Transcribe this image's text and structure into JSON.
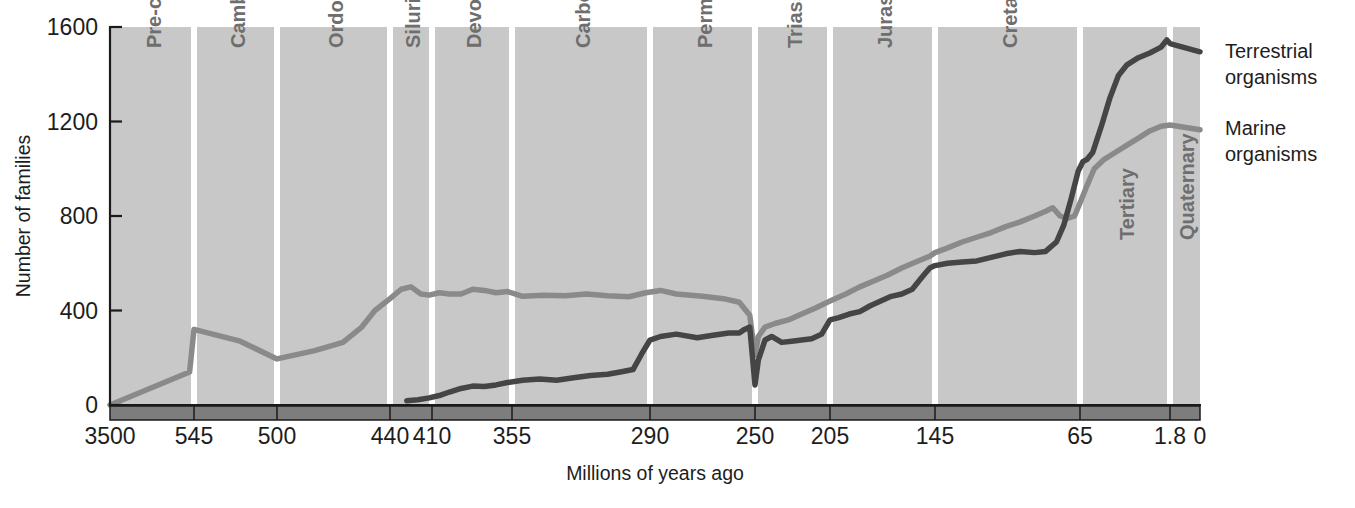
{
  "chart_data": {
    "type": "line",
    "title": "",
    "xlabel": "Millions of years ago",
    "ylabel": "Number of families",
    "ylim": [
      0,
      1600
    ],
    "yticks": [
      0,
      400,
      800,
      1200,
      1600
    ],
    "ytick_labels": [
      "0",
      "400",
      "800",
      "1200",
      "1600"
    ],
    "xticks": [
      3500,
      545,
      500,
      440,
      410,
      355,
      290,
      250,
      205,
      145,
      65,
      1.8,
      0
    ],
    "xtick_labels": [
      "3500",
      "545",
      "500",
      "440",
      "410",
      "355",
      "290",
      "250",
      "205",
      "145",
      "65",
      "1.8",
      "0"
    ],
    "x_axis_direction": "reversed",
    "grid": false,
    "legend_position": "right",
    "bands": [
      {
        "label": "Pre-cambrian",
        "start": 3500,
        "end": 545
      },
      {
        "label": "Cambrian",
        "start": 545,
        "end": 500
      },
      {
        "label": "Ordovician",
        "start": 500,
        "end": 440
      },
      {
        "label": "Silurian",
        "start": 440,
        "end": 410
      },
      {
        "label": "Devonian",
        "start": 410,
        "end": 355
      },
      {
        "label": "Carboniferous",
        "start": 355,
        "end": 290
      },
      {
        "label": "Permian",
        "start": 290,
        "end": 250
      },
      {
        "label": "Triassic",
        "start": 250,
        "end": 205
      },
      {
        "label": "Jurassic",
        "start": 205,
        "end": 145
      },
      {
        "label": "Cretaceous",
        "start": 145,
        "end": 65
      },
      {
        "label": "Tertiary",
        "start": 65,
        "end": 1.8
      },
      {
        "label": "Quaternary",
        "start": 1.8,
        "end": 0
      }
    ],
    "series": [
      {
        "name": "Marine organisms",
        "color": "#8a8a8a",
        "points": [
          [
            3500,
            0
          ],
          [
            700,
            140
          ],
          [
            545,
            320
          ],
          [
            520,
            270
          ],
          [
            500,
            195
          ],
          [
            480,
            230
          ],
          [
            465,
            265
          ],
          [
            455,
            330
          ],
          [
            448,
            400
          ],
          [
            440,
            450
          ],
          [
            432,
            490
          ],
          [
            425,
            500
          ],
          [
            418,
            470
          ],
          [
            412,
            465
          ],
          [
            405,
            475
          ],
          [
            398,
            470
          ],
          [
            390,
            470
          ],
          [
            382,
            490
          ],
          [
            374,
            485
          ],
          [
            366,
            475
          ],
          [
            358,
            480
          ],
          [
            350,
            460
          ],
          [
            340,
            465
          ],
          [
            330,
            462
          ],
          [
            320,
            470
          ],
          [
            310,
            462
          ],
          [
            300,
            458
          ],
          [
            292,
            475
          ],
          [
            286,
            485
          ],
          [
            280,
            470
          ],
          [
            270,
            460
          ],
          [
            262,
            450
          ],
          [
            256,
            435
          ],
          [
            252,
            380
          ],
          [
            250,
            210
          ],
          [
            248,
            290
          ],
          [
            244,
            330
          ],
          [
            238,
            345
          ],
          [
            230,
            360
          ],
          [
            222,
            385
          ],
          [
            214,
            410
          ],
          [
            205,
            440
          ],
          [
            196,
            470
          ],
          [
            188,
            500
          ],
          [
            180,
            525
          ],
          [
            172,
            550
          ],
          [
            164,
            580
          ],
          [
            156,
            605
          ],
          [
            148,
            630
          ],
          [
            145,
            645
          ],
          [
            138,
            665
          ],
          [
            130,
            690
          ],
          [
            122,
            710
          ],
          [
            114,
            730
          ],
          [
            106,
            755
          ],
          [
            98,
            775
          ],
          [
            90,
            800
          ],
          [
            84,
            820
          ],
          [
            80,
            835
          ],
          [
            76,
            800
          ],
          [
            72,
            790
          ],
          [
            68,
            800
          ],
          [
            65,
            855
          ],
          [
            60,
            930
          ],
          [
            55,
            1000
          ],
          [
            48,
            1040
          ],
          [
            40,
            1070
          ],
          [
            32,
            1100
          ],
          [
            24,
            1130
          ],
          [
            16,
            1160
          ],
          [
            8,
            1180
          ],
          [
            1.8,
            1185
          ],
          [
            0,
            1165
          ]
        ]
      },
      {
        "name": "Terrestrial organisms",
        "color": "#454545",
        "points": [
          [
            428,
            18
          ],
          [
            420,
            22
          ],
          [
            412,
            30
          ],
          [
            405,
            40
          ],
          [
            398,
            55
          ],
          [
            390,
            70
          ],
          [
            382,
            80
          ],
          [
            374,
            78
          ],
          [
            366,
            85
          ],
          [
            358,
            95
          ],
          [
            350,
            105
          ],
          [
            342,
            110
          ],
          [
            334,
            105
          ],
          [
            326,
            115
          ],
          [
            318,
            125
          ],
          [
            310,
            130
          ],
          [
            304,
            140
          ],
          [
            298,
            150
          ],
          [
            294,
            215
          ],
          [
            290,
            275
          ],
          [
            286,
            290
          ],
          [
            280,
            300
          ],
          [
            272,
            285
          ],
          [
            266,
            295
          ],
          [
            260,
            305
          ],
          [
            256,
            305
          ],
          [
            254,
            320
          ],
          [
            252,
            330
          ],
          [
            250,
            85
          ],
          [
            248,
            190
          ],
          [
            244,
            275
          ],
          [
            240,
            290
          ],
          [
            234,
            265
          ],
          [
            228,
            270
          ],
          [
            222,
            275
          ],
          [
            216,
            280
          ],
          [
            210,
            300
          ],
          [
            205,
            360
          ],
          [
            200,
            370
          ],
          [
            194,
            385
          ],
          [
            188,
            395
          ],
          [
            182,
            420
          ],
          [
            176,
            440
          ],
          [
            170,
            460
          ],
          [
            164,
            470
          ],
          [
            158,
            490
          ],
          [
            152,
            545
          ],
          [
            148,
            580
          ],
          [
            145,
            590
          ],
          [
            138,
            600
          ],
          [
            130,
            605
          ],
          [
            122,
            610
          ],
          [
            114,
            625
          ],
          [
            106,
            640
          ],
          [
            98,
            650
          ],
          [
            90,
            645
          ],
          [
            84,
            650
          ],
          [
            78,
            690
          ],
          [
            74,
            760
          ],
          [
            70,
            870
          ],
          [
            66,
            990
          ],
          [
            63,
            1030
          ],
          [
            60,
            1040
          ],
          [
            56,
            1070
          ],
          [
            50,
            1180
          ],
          [
            44,
            1300
          ],
          [
            38,
            1395
          ],
          [
            32,
            1440
          ],
          [
            24,
            1470
          ],
          [
            16,
            1490
          ],
          [
            8,
            1515
          ],
          [
            4,
            1545
          ],
          [
            1.8,
            1530
          ],
          [
            0,
            1495
          ]
        ]
      }
    ],
    "legend": [
      {
        "label_line1": "Terrestrial",
        "label_line2": "organisms",
        "color": "#454545"
      },
      {
        "label_line1": "Marine",
        "label_line2": "organisms",
        "color": "#8a8a8a"
      }
    ],
    "colors": {
      "plot_background": "#c8c8c8",
      "band_divider": "#ffffff",
      "baseline_band": "#7d7d7d",
      "axis": "#1a1a1a",
      "period_label": "#6e6e6e"
    }
  }
}
